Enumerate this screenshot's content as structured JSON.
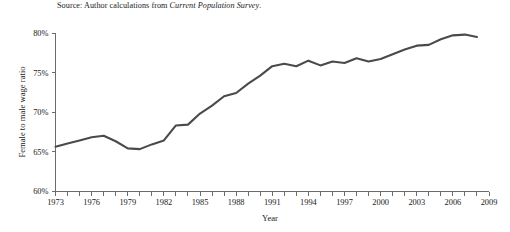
{
  "source_note": {
    "prefix": "Source: Author calculations from ",
    "italic_part": "Current Population Survey",
    "suffix": "."
  },
  "chart_data": {
    "type": "line",
    "title": "",
    "xlabel": "Year",
    "ylabel": "Female to male wage ratio",
    "xlim": [
      1973,
      2009
    ],
    "ylim": [
      60,
      80
    ],
    "grid": false,
    "legend": null,
    "line_color": "#4a4a4a",
    "axis_color": "#6b6b6b",
    "y_tick_labels": [
      "80%",
      "75%",
      "70%",
      "65%",
      "60%"
    ],
    "y_tick_values": [
      80,
      75,
      70,
      65,
      60
    ],
    "x_tick_values": [
      1973,
      1974,
      1975,
      1976,
      1977,
      1978,
      1979,
      1980,
      1981,
      1982,
      1983,
      1984,
      1985,
      1986,
      1987,
      1988,
      1989,
      1990,
      1991,
      1992,
      1993,
      1994,
      1995,
      1996,
      1997,
      1998,
      1999,
      2000,
      2001,
      2002,
      2003,
      2004,
      2005,
      2006,
      2007,
      2008,
      2009
    ],
    "x_tick_labels": [
      "1973",
      "1976",
      "1979",
      "1982",
      "1985",
      "1988",
      "1991",
      "1994",
      "1997",
      "2000",
      "2003",
      "2006",
      "2009"
    ],
    "x_labeled_values": [
      1973,
      1976,
      1979,
      1982,
      1985,
      1988,
      1991,
      1994,
      1997,
      2000,
      2003,
      2006,
      2009
    ],
    "x": [
      1973,
      1974,
      1975,
      1976,
      1977,
      1978,
      1979,
      1980,
      1981,
      1982,
      1983,
      1984,
      1985,
      1986,
      1987,
      1988,
      1989,
      1990,
      1991,
      1992,
      1993,
      1994,
      1995,
      1996,
      1997,
      1998,
      1999,
      2000,
      2001,
      2002,
      2003,
      2004,
      2005,
      2006,
      2007,
      2008
    ],
    "values": [
      65.6,
      66.0,
      66.4,
      66.8,
      67.0,
      66.3,
      65.4,
      65.3,
      65.9,
      66.4,
      68.3,
      68.4,
      69.8,
      70.8,
      72.0,
      72.4,
      73.6,
      74.6,
      75.8,
      76.1,
      75.8,
      76.5,
      75.9,
      76.4,
      76.2,
      76.8,
      76.4,
      76.7,
      77.3,
      77.9,
      78.4,
      78.5,
      79.2,
      79.7,
      79.8,
      79.5
    ]
  }
}
